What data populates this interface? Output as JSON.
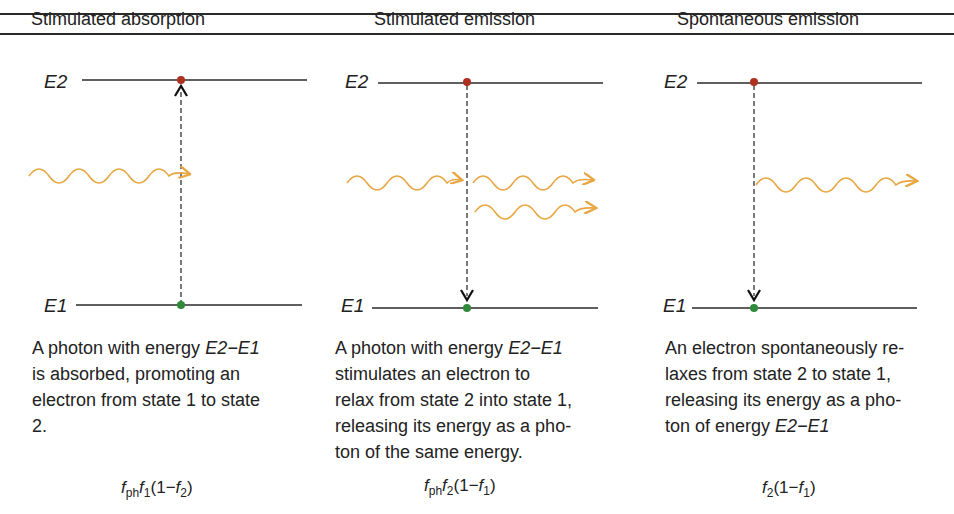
{
  "columns": [
    {
      "header": "Stimulated absorption",
      "levels": {
        "upper": "E2",
        "lower": "E1"
      },
      "transition": "up",
      "photons_in": 1,
      "photons_out": 0,
      "description": {
        "lines": [
          "A photon with energy ",
          "is absorbed, promoting an",
          "electron from state 1 to state",
          "2."
        ],
        "energy_expr": "E2−E1"
      },
      "formula": {
        "a": "f",
        "a_sub": "ph",
        "b": "f",
        "b_sub": "1",
        "open": "(1−",
        "c": "f",
        "c_sub": "2",
        "close": ")"
      }
    },
    {
      "header": "Stimulated emission",
      "levels": {
        "upper": "E2",
        "lower": "E1"
      },
      "transition": "down",
      "photons_in": 1,
      "photons_out": 2,
      "description": {
        "lines": [
          "A photon with energy ",
          "stimulates an electron to",
          "relax from state 2 into state 1,",
          "releasing its energy as a pho-",
          "ton of the same energy."
        ],
        "energy_expr": "E2−E1"
      },
      "formula": {
        "a": "f",
        "a_sub": "ph",
        "b": "f",
        "b_sub": "2",
        "open": "(1−",
        "c": "f",
        "c_sub": "1",
        "close": ")"
      }
    },
    {
      "header": "Spontaneous emission",
      "levels": {
        "upper": "E2",
        "lower": "E1"
      },
      "transition": "down",
      "photons_in": 0,
      "photons_out": 1,
      "description": {
        "lines": [
          "An electron spontaneously re-",
          "laxes from state 2 to state 1,",
          "releasing its energy as a pho-",
          "ton of energy "
        ],
        "energy_expr": "E2−E1"
      },
      "formula": {
        "b": "f",
        "b_sub": "2",
        "open": "(1−",
        "c": "f",
        "c_sub": "1",
        "close": ")"
      }
    }
  ],
  "colors": {
    "photon": "#e8a640",
    "upper_electron": "#b03020",
    "lower_electron": "#2f8a3a",
    "line": "#2a2a2a"
  }
}
